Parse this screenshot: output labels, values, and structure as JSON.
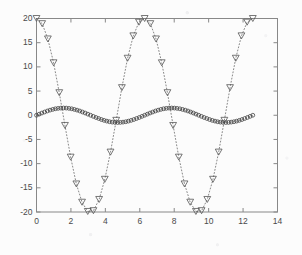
{
  "figure": {
    "title": "",
    "background_color": "#fcfcfc",
    "axes_color": "#888888",
    "tick_label_color": "#4a4a4a"
  },
  "chart_data": {
    "type": "line",
    "title": "",
    "subtitle": "",
    "xlabel": "",
    "ylabel": "",
    "xlim": [
      0,
      14
    ],
    "ylim": [
      -20,
      20
    ],
    "xticks": [
      0,
      2,
      4,
      6,
      8,
      10,
      12,
      14
    ],
    "yticks": [
      -20,
      -15,
      -10,
      -5,
      0,
      5,
      10,
      15,
      20
    ],
    "xtick_labels": [
      "0",
      "2",
      "4",
      "6",
      "8",
      "10",
      "12",
      "14"
    ],
    "ytick_labels": [
      "-20",
      "-15",
      "-10",
      "-5",
      "0",
      "5",
      "10",
      "15",
      "20"
    ],
    "grid": false,
    "legend": null,
    "legend_position": "none",
    "box": true,
    "series": [
      {
        "name": "large-amplitude-cosine",
        "marker": "triangle-down",
        "marker_filled": false,
        "linestyle": "dotted",
        "color": "#555555",
        "amplitude": 20,
        "period": 6.2832,
        "phase": "cosine",
        "x": [
          0,
          0.3307,
          0.6614,
          0.9921,
          1.3228,
          1.6535,
          1.9842,
          2.3149,
          2.6456,
          2.9762,
          3.3069,
          3.6376,
          3.9683,
          4.299,
          4.6297,
          4.9604,
          5.2911,
          5.6218,
          5.9525,
          6.2832,
          6.6139,
          6.9446,
          7.2753,
          7.606,
          7.9367,
          8.2674,
          8.5981,
          8.9288,
          9.2595,
          9.5902,
          9.9209,
          10.2516,
          10.5823,
          10.913,
          11.2437,
          11.5744,
          11.9051,
          12.2358,
          12.5664
        ],
        "y": [
          20,
          18.93,
          15.77,
          10.84,
          4.66,
          -2.11,
          -8.66,
          -14.2,
          -17.98,
          -19.89,
          -19.73,
          -17.41,
          -13.24,
          -7.62,
          -1.05,
          5.7,
          11.78,
          16.41,
          19.24,
          20,
          18.93,
          15.77,
          10.84,
          4.66,
          -2.11,
          -8.66,
          -14.2,
          -17.98,
          -19.89,
          -19.73,
          -17.41,
          -13.24,
          -7.62,
          -1.05,
          5.7,
          11.78,
          16.41,
          19.24,
          20
        ]
      },
      {
        "name": "small-amplitude-sine",
        "marker": "circle",
        "marker_filled": false,
        "linestyle": "dotted",
        "color": "#444444",
        "amplitude": 1.5,
        "period": 6.2832,
        "phase": "sine",
        "x": [
          0,
          0.1571,
          0.3142,
          0.4712,
          0.6283,
          0.7854,
          0.9425,
          1.0996,
          1.2566,
          1.4137,
          1.5708,
          1.7279,
          1.885,
          2.042,
          2.1991,
          2.3562,
          2.5133,
          2.6704,
          2.8274,
          2.9845,
          3.1416,
          3.2987,
          3.4558,
          3.6128,
          3.7699,
          3.927,
          4.0841,
          4.2412,
          4.3982,
          4.5553,
          4.7124,
          4.8695,
          5.0265,
          5.1836,
          5.3407,
          5.4978,
          5.6549,
          5.8119,
          5.969,
          6.1261,
          6.2832,
          6.4403,
          6.5973,
          6.7544,
          6.9115,
          7.0686,
          7.2257,
          7.3827,
          7.5398,
          7.6969,
          7.854,
          8.0111,
          8.1681,
          8.3252,
          8.4823,
          8.6394,
          8.7965,
          8.9535,
          9.1106,
          9.2677,
          9.4248,
          9.5819,
          9.739,
          9.896,
          10.0531,
          10.2102,
          10.3673,
          10.5243,
          10.6814,
          10.8385,
          10.9956,
          11.1527,
          11.3097,
          11.4668,
          11.6239,
          11.781,
          11.9381,
          12.0951,
          12.2522,
          12.4093,
          12.5664
        ],
        "y": [
          0,
          0.23,
          0.46,
          0.67,
          0.88,
          1.06,
          1.21,
          1.34,
          1.42,
          1.48,
          1.5,
          1.48,
          1.42,
          1.34,
          1.21,
          1.06,
          0.88,
          0.67,
          0.46,
          0.23,
          0,
          -0.23,
          -0.46,
          -0.67,
          -0.88,
          -1.06,
          -1.21,
          -1.34,
          -1.42,
          -1.48,
          -1.5,
          -1.48,
          -1.42,
          -1.34,
          -1.21,
          -1.06,
          -0.88,
          -0.67,
          -0.46,
          -0.23,
          0,
          0.23,
          0.46,
          0.67,
          0.88,
          1.06,
          1.21,
          1.34,
          1.42,
          1.48,
          1.5,
          1.48,
          1.42,
          1.34,
          1.21,
          1.06,
          0.88,
          0.67,
          0.46,
          0.23,
          0,
          -0.23,
          -0.46,
          -0.67,
          -0.88,
          -1.06,
          -1.21,
          -1.34,
          -1.42,
          -1.48,
          -1.5,
          -1.48,
          -1.42,
          -1.34,
          -1.21,
          -1.06,
          -0.88,
          -0.67,
          -0.46,
          -0.23,
          0
        ]
      }
    ]
  }
}
